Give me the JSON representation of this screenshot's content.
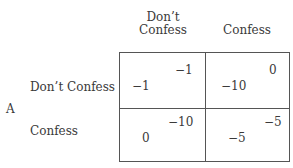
{
  "matrix": {
    "row_player": "A",
    "columns": [
      {
        "label_line1": "Don’t",
        "label_line2": "Confess"
      },
      {
        "label_line1": "",
        "label_line2": "Confess"
      }
    ],
    "rows": [
      {
        "label": "Don’t Confess",
        "cells": [
          {
            "col_payoff": "−1",
            "row_payoff": "−1"
          },
          {
            "col_payoff": "0",
            "row_payoff": "−10"
          }
        ]
      },
      {
        "label": "Confess",
        "cells": [
          {
            "col_payoff": "−10",
            "row_payoff": "0"
          },
          {
            "col_payoff": "−5",
            "row_payoff": "−5"
          }
        ]
      }
    ]
  },
  "colors": {
    "text": "#3a3a3a",
    "grid_line": "#555555",
    "background": "#ffffff"
  }
}
